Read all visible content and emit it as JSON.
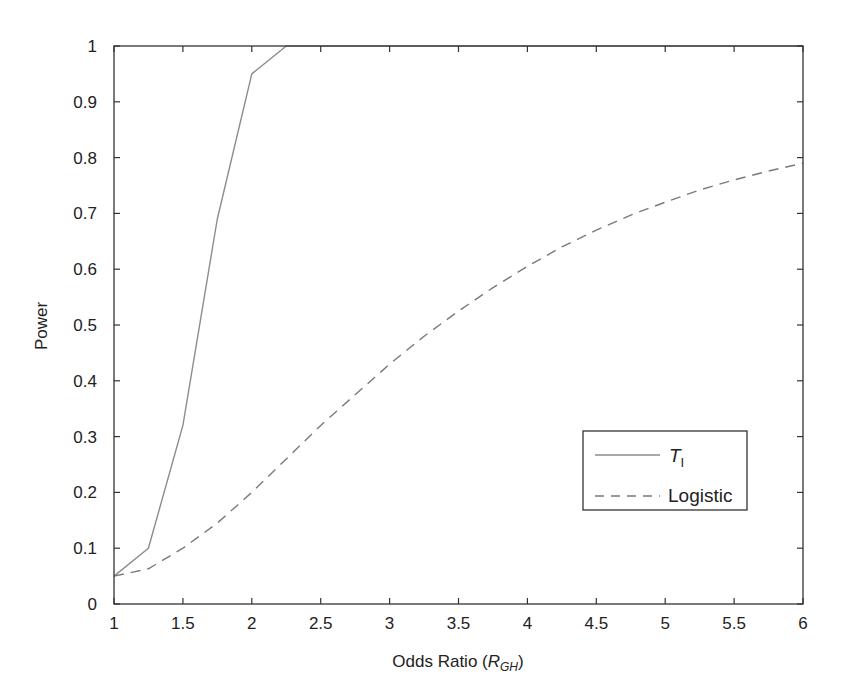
{
  "chart_data": {
    "type": "line",
    "title": "",
    "xlabel": "Odds Ratio (R_GH)",
    "xlabel_parts": {
      "main": "Odds Ratio (",
      "italic": "R",
      "sub": "GH",
      "close": ")"
    },
    "ylabel": "Power",
    "xlim": [
      1,
      6
    ],
    "ylim": [
      0,
      1
    ],
    "grid": false,
    "legend_position": "lower right",
    "x_ticks": [
      1,
      1.5,
      2,
      2.5,
      3,
      3.5,
      4,
      4.5,
      5,
      5.5,
      6
    ],
    "x_tick_labels": [
      "1",
      "1.5",
      "2",
      "2.5",
      "3",
      "3.5",
      "4",
      "4.5",
      "5",
      "5.5",
      "6"
    ],
    "y_ticks": [
      0,
      0.1,
      0.2,
      0.3,
      0.4,
      0.5,
      0.6,
      0.7,
      0.8,
      0.9,
      1
    ],
    "y_tick_labels": [
      "0",
      "0.1",
      "0.2",
      "0.3",
      "0.4",
      "0.5",
      "0.6",
      "0.7",
      "0.8",
      "0.9",
      "1"
    ],
    "series": [
      {
        "name": "T_I",
        "label_main": "T",
        "label_sub": "I",
        "style": "solid",
        "color": "#8c8c8c",
        "x": [
          1,
          1.25,
          1.5,
          1.75,
          2,
          2.25,
          2.5,
          3,
          3.5,
          4,
          4.5,
          5,
          5.5,
          6
        ],
        "values": [
          0.05,
          0.1,
          0.32,
          0.69,
          0.95,
          1.0,
          1.0,
          1.0,
          1.0,
          1.0,
          1.0,
          1.0,
          1.0,
          1.0
        ]
      },
      {
        "name": "Logistic",
        "label_main": "Logistic",
        "label_sub": "",
        "style": "dashed",
        "color": "#7a7a7a",
        "x": [
          1,
          1.25,
          1.5,
          1.75,
          2,
          2.25,
          2.5,
          2.75,
          3,
          3.25,
          3.5,
          3.75,
          4,
          4.25,
          4.5,
          4.75,
          5,
          5.25,
          5.5,
          5.75,
          6
        ],
        "values": [
          0.05,
          0.063,
          0.1,
          0.145,
          0.2,
          0.26,
          0.32,
          0.375,
          0.43,
          0.48,
          0.525,
          0.567,
          0.605,
          0.64,
          0.67,
          0.697,
          0.72,
          0.742,
          0.76,
          0.776,
          0.79
        ]
      }
    ]
  }
}
